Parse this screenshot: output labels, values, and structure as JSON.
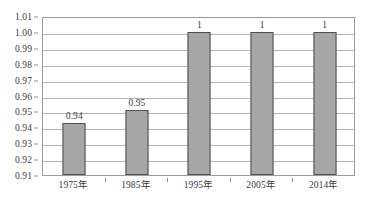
{
  "chart_data": {
    "type": "bar",
    "title": "",
    "subtitle": "",
    "xlabel": "",
    "ylabel": "",
    "categories": [
      "1975年",
      "1985年",
      "1995年",
      "2005年",
      "2014年"
    ],
    "values": [
      0.943,
      0.951,
      1.0,
      1.0,
      1.0
    ],
    "data_labels": [
      "0.94",
      "0.95",
      "1",
      "1",
      "1"
    ],
    "ylim": [
      0.91,
      1.01
    ],
    "ytick_step": 0.01,
    "ytick_labels": [
      "1.01",
      "1.00",
      "0.99",
      "0.98",
      "0.97",
      "0.96",
      "0.95",
      "0.94",
      "0.93",
      "0.92",
      "0.91"
    ],
    "ytick_values": [
      1.01,
      1.0,
      0.99,
      0.98,
      0.97,
      0.96,
      0.95,
      0.94,
      0.93,
      0.92,
      0.91
    ],
    "grid": true,
    "grid_axis": "y",
    "legend": false,
    "legend_position": "none",
    "series": [
      {
        "name": "",
        "values": [
          0.943,
          0.951,
          1.0,
          1.0,
          1.0
        ]
      }
    ],
    "colors": {
      "bar_fill": "#a6a6a6",
      "bar_border": "#4f4f4f",
      "gridline": "#b4b4b4",
      "plot_border": "#9b9b9b",
      "text": "#3c3c3c",
      "background": "#ffffff"
    }
  }
}
